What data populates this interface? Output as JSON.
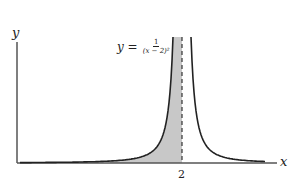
{
  "chart_data": {
    "type": "line",
    "title": "",
    "function": "y = 1/(x-2)^2",
    "equation_label": {
      "lhs": "y =",
      "numerator": "1",
      "denominator": "(x − 2)²"
    },
    "xlabel": "x",
    "ylabel": "y",
    "x_ticks": [
      {
        "value": 2,
        "label": "2"
      }
    ],
    "asymptote": {
      "x": 2,
      "style": "dashed"
    },
    "shaded_region": {
      "description": "area under curve left of x = 2",
      "color": "#c8c8c8"
    },
    "grid": false,
    "legend": null,
    "colors": {
      "curve": "#222222",
      "axis": "#555555",
      "shade": "#c8c8c8"
    }
  }
}
